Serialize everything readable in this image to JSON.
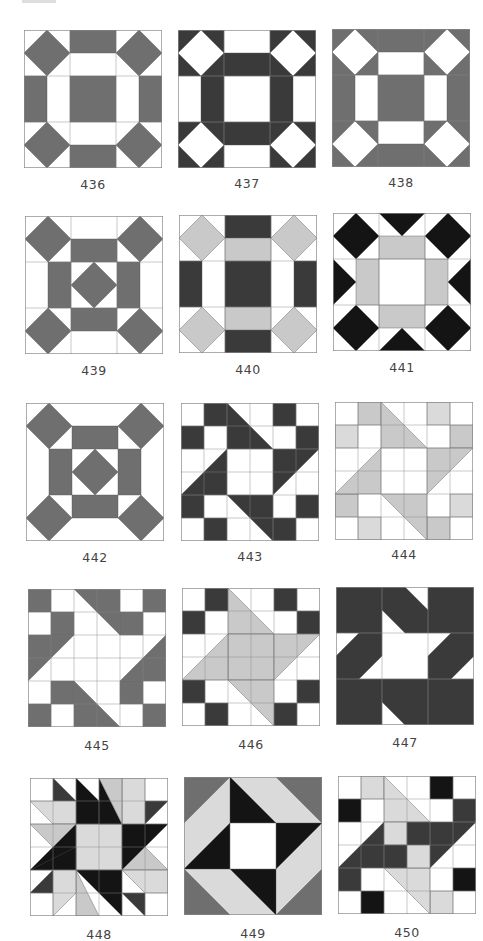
{
  "colors": {
    "white": "#ffffff",
    "medium": "#6f6f6f",
    "dark": "#3a3a3a",
    "black": "#141414",
    "light": "#c9c9c9",
    "pale": "#dadada",
    "grid": "#8a8a8a"
  },
  "blocks": [
    {
      "number": "436",
      "x": 24,
      "y": 30,
      "label_y": 185,
      "grid": 3,
      "bg": "white",
      "shapes": [
        [
          "medium",
          "2,0 4,0 4,1 2,1"
        ],
        [
          "medium",
          "2,5 4,5 4,6 2,6"
        ],
        [
          "medium",
          "0,2 1,2 1,4 0,4"
        ],
        [
          "medium",
          "5,2 6,2 6,4 5,4"
        ],
        [
          "medium",
          "2,2 4,2 4,4 2,4"
        ],
        [
          "medium",
          "1,0 2,1 1,2 0,1"
        ],
        [
          "medium",
          "5,0 6,1 5,2 4,1"
        ],
        [
          "medium",
          "1,4 2,5 1,6 0,5"
        ],
        [
          "medium",
          "5,4 6,5 5,6 4,5"
        ]
      ]
    },
    {
      "number": "437",
      "x": 178,
      "y": 30,
      "label_y": 184,
      "grid": 3,
      "bg": "white",
      "shapes": [
        [
          "dark",
          "0,0 2,0 2,2 0,2"
        ],
        [
          "dark",
          "4,0 6,0 6,2 4,2"
        ],
        [
          "dark",
          "0,4 2,4 2,6 0,6"
        ],
        [
          "dark",
          "4,4 6,4 6,6 4,6"
        ],
        [
          "white",
          "1,0 2,1 1,2 0,1"
        ],
        [
          "white",
          "5,0 6,1 5,2 4,1"
        ],
        [
          "white",
          "1,4 2,5 1,6 0,5"
        ],
        [
          "white",
          "5,4 6,5 5,6 4,5"
        ],
        [
          "dark",
          "2,1 4,1 4,2 2,2"
        ],
        [
          "dark",
          "2,4 4,4 4,5 2,5"
        ],
        [
          "dark",
          "1,2 2,2 2,4 1,4"
        ],
        [
          "dark",
          "4,2 5,2 5,4 4,4"
        ]
      ]
    },
    {
      "number": "438",
      "x": 332,
      "y": 29,
      "label_y": 183,
      "grid": 3,
      "bg": "medium",
      "shapes": [
        [
          "white",
          "1,0 2,1 1,2 0,1"
        ],
        [
          "white",
          "5,0 6,1 5,2 4,1"
        ],
        [
          "white",
          "1,4 2,5 1,6 0,5"
        ],
        [
          "white",
          "5,4 6,5 5,6 4,5"
        ],
        [
          "white",
          "2,1 4,1 4,2 2,2"
        ],
        [
          "white",
          "2,4 4,4 4,5 2,5"
        ],
        [
          "white",
          "1,2 2,2 2,4 1,4"
        ],
        [
          "white",
          "4,2 5,2 5,4 4,4"
        ]
      ]
    },
    {
      "number": "439",
      "x": 25,
      "y": 216,
      "label_y": 371,
      "grid": 3,
      "bg": "white",
      "shapes": [
        [
          "medium",
          "2,1 4,1 4,2 2,2"
        ],
        [
          "medium",
          "2,4 4,4 4,5 2,5"
        ],
        [
          "medium",
          "1,2 2,2 2,4 1,4"
        ],
        [
          "medium",
          "4,2 5,2 5,4 4,4"
        ],
        [
          "medium",
          "3,2 4,3 3,4 2,3"
        ],
        [
          "medium",
          "1,0 2,1 1,2 0,1"
        ],
        [
          "medium",
          "5,0 6,1 5,2 4,1"
        ],
        [
          "medium",
          "1,4 2,5 1,6 0,5"
        ],
        [
          "medium",
          "5,4 6,5 5,6 4,5"
        ]
      ]
    },
    {
      "number": "440",
      "x": 179,
      "y": 215,
      "label_y": 370,
      "grid": 3,
      "bg": "white",
      "shapes": [
        [
          "dark",
          "2,0 4,0 4,1 2,1"
        ],
        [
          "dark",
          "2,5 4,5 4,6 2,6"
        ],
        [
          "dark",
          "2,2 4,2 4,4 2,4"
        ],
        [
          "dark",
          "0,2 1,2 1,4 0,4"
        ],
        [
          "dark",
          "5,2 6,2 6,4 5,4"
        ],
        [
          "light",
          "2,1 4,1 4,2 2,2"
        ],
        [
          "light",
          "2,4 4,4 4,5 2,5"
        ],
        [
          "light",
          "1,0 2,1 1,2 0,1"
        ],
        [
          "light",
          "5,0 6,1 5,2 4,1"
        ],
        [
          "light",
          "1,4 2,5 1,6 0,5"
        ],
        [
          "light",
          "5,4 6,5 5,6 4,5"
        ]
      ]
    },
    {
      "number": "441",
      "x": 333,
      "y": 213,
      "label_y": 368,
      "grid": 3,
      "bg": "white",
      "shapes": [
        [
          "black",
          "1,0 2,1 1,2 0,1"
        ],
        [
          "black",
          "5,0 6,1 5,2 4,1"
        ],
        [
          "black",
          "1,4 2,5 1,6 0,5"
        ],
        [
          "black",
          "5,4 6,5 5,6 4,5"
        ],
        [
          "black",
          "2,0 4,0 3,1"
        ],
        [
          "black",
          "2,6 4,6 3,5"
        ],
        [
          "black",
          "0,2 0,4 1,3"
        ],
        [
          "black",
          "6,2 6,4 5,3"
        ],
        [
          "light",
          "2,1 4,1 4,2 2,2"
        ],
        [
          "light",
          "2,4 4,4 4,5 2,5"
        ],
        [
          "light",
          "1,2 2,2 2,4 1,4"
        ],
        [
          "light",
          "4,2 5,2 5,4 4,4"
        ]
      ]
    },
    {
      "number": "442",
      "x": 26,
      "y": 403,
      "label_y": 558,
      "grid": 0,
      "bg": "white",
      "shapes": [
        [
          "medium",
          "2,1 4,1 4,2 2,2"
        ],
        [
          "medium",
          "2,4 4,4 4,5 2,5"
        ],
        [
          "medium",
          "1,2 2,2 2,4 1,4"
        ],
        [
          "medium",
          "4,2 5,2 5,4 4,4"
        ],
        [
          "medium",
          "3,2 4,3 3,4 2,3"
        ],
        [
          "medium",
          "1,0 2,1 1,2 0,1"
        ],
        [
          "medium",
          "5,0 6,1 5,2 4,1"
        ],
        [
          "medium",
          "1,4 2,5 1,6 0,5"
        ],
        [
          "medium",
          "5,4 6,5 5,6 4,5"
        ]
      ]
    },
    {
      "number": "443",
      "x": 181,
      "y": 403,
      "label_y": 557,
      "grid": 6,
      "bg": "white",
      "shapes": [
        [
          "dark",
          "1,0 2,0 2,1 1,1"
        ],
        [
          "dark",
          "0,1 1,1 1,2 0,2"
        ],
        [
          "dark",
          "4,0 5,0 5,1 4,1"
        ],
        [
          "dark",
          "5,1 6,1 6,2 5,2"
        ],
        [
          "dark",
          "0,4 1,4 1,5 0,5"
        ],
        [
          "dark",
          "1,5 2,5 2,6 1,6"
        ],
        [
          "dark",
          "5,4 6,4 6,5 5,5"
        ],
        [
          "dark",
          "4,5 5,5 5,6 4,6"
        ],
        [
          "dark",
          "2,0 4,2 2,2"
        ],
        [
          "dark",
          "4,2 6,2 4,4"
        ],
        [
          "dark",
          "2,2 2,4 0,4"
        ],
        [
          "dark",
          "2,4 4,4 4,6"
        ]
      ]
    },
    {
      "number": "444",
      "x": 335,
      "y": 402,
      "label_y": 555,
      "grid": 6,
      "bg": "white",
      "shapes": [
        [
          "light",
          "1,0 2,0 2,1 1,1"
        ],
        [
          "pale",
          "0,1 1,1 1,2 0,2"
        ],
        [
          "pale",
          "4,0 5,0 5,1 4,1"
        ],
        [
          "light",
          "5,1 6,1 6,2 5,2"
        ],
        [
          "light",
          "0,4 1,4 1,5 0,5"
        ],
        [
          "pale",
          "1,5 2,5 2,6 1,6"
        ],
        [
          "pale",
          "5,4 6,4 6,5 5,5"
        ],
        [
          "light",
          "4,5 5,5 5,6 4,6"
        ],
        [
          "light",
          "2,0 4,2 2,2"
        ],
        [
          "light",
          "4,2 6,2 4,4"
        ],
        [
          "light",
          "2,2 2,4 0,4"
        ],
        [
          "light",
          "2,4 4,4 4,6"
        ]
      ]
    },
    {
      "number": "445",
      "x": 28,
      "y": 589,
      "label_y": 746,
      "grid": 6,
      "bg": "white",
      "shapes": [
        [
          "medium",
          "0,0 1,0 1,1 0,1"
        ],
        [
          "medium",
          "1,1 2,1 2,2 1,2"
        ],
        [
          "medium",
          "5,0 6,0 6,1 5,1"
        ],
        [
          "medium",
          "4,1 5,1 5,2 4,2"
        ],
        [
          "medium",
          "1,4 2,4 2,5 1,5"
        ],
        [
          "medium",
          "0,5 1,5 1,6 0,6"
        ],
        [
          "medium",
          "4,4 5,4 5,5 4,5"
        ],
        [
          "medium",
          "5,5 6,5 6,6 5,6"
        ],
        [
          "medium",
          "2,0 4,0 4,2"
        ],
        [
          "medium",
          "0,2 2,2 0,4"
        ],
        [
          "medium",
          "6,2 6,4 4,4"
        ],
        [
          "medium",
          "2,4 2,6 4,6"
        ]
      ]
    },
    {
      "number": "446",
      "x": 182,
      "y": 588,
      "label_y": 745,
      "grid": 6,
      "bg": "white",
      "shapes": [
        [
          "dark",
          "1,0 2,0 2,1 1,1"
        ],
        [
          "dark",
          "0,1 1,1 1,2 0,2"
        ],
        [
          "dark",
          "4,0 5,0 5,1 4,1"
        ],
        [
          "dark",
          "5,1 6,1 6,2 5,2"
        ],
        [
          "dark",
          "0,4 1,4 1,5 0,5"
        ],
        [
          "dark",
          "1,5 2,5 2,6 1,6"
        ],
        [
          "dark",
          "5,4 6,4 6,5 5,5"
        ],
        [
          "dark",
          "4,5 5,5 5,6 4,6"
        ],
        [
          "light",
          "2,0 4,2 2,2"
        ],
        [
          "light",
          "2,2 4,2 4,4 2,4"
        ],
        [
          "light",
          "4,2 6,2 4,4"
        ],
        [
          "light",
          "2,2 2,4 0,4"
        ],
        [
          "light",
          "2,4 4,4 4,6"
        ]
      ]
    },
    {
      "number": "447",
      "x": 336,
      "y": 587,
      "label_y": 743,
      "grid": 3,
      "bg": "white",
      "shapes": [
        [
          "dark",
          "0,0 2,0 2,2 0,2"
        ],
        [
          "dark",
          "4,0 6,0 6,2 4,2"
        ],
        [
          "dark",
          "0,4 2,4 2,6 0,6"
        ],
        [
          "dark",
          "4,4 6,4 6,6 4,6"
        ],
        [
          "dark",
          "2,0 3,0 4,1 4,2 3,2 2,1"
        ],
        [
          "dark",
          "4,4 4,6 3,6 2,5 2,4 3,4"
        ],
        [
          "dark",
          "1,2 2,2 2,3 1,4 0,4 0,3"
        ],
        [
          "dark",
          "5,2 6,2 6,3 5,4 4,4 4,3"
        ]
      ]
    },
    {
      "number": "448",
      "x": 30,
      "y": 778,
      "label_y": 935,
      "grid": 6,
      "bg": "white",
      "shapes": [
        [
          "pale",
          "2,2 4,2 4,4 2,4"
        ],
        [
          "black",
          "2,0 4,2 2,2"
        ],
        [
          "black",
          "4,2 6,2 4,4"
        ],
        [
          "black",
          "2,2 2,4 0,4"
        ],
        [
          "black",
          "2,4 4,4 4,6"
        ],
        [
          "black",
          "3,0 4,2 3,2"
        ],
        [
          "black",
          "0,4 2,3 2,4"
        ],
        [
          "dark",
          "1,0 2,1 1,1"
        ],
        [
          "dark",
          "5,1 6,1 5,2"
        ],
        [
          "dark",
          "0,5 1,4 1,5"
        ],
        [
          "dark",
          "4,5 5,5 5,6"
        ],
        [
          "pale",
          "0,1 2,1 2,2 1,2"
        ],
        [
          "pale",
          "4,0 5,0 5,2 4,2 4,1"
        ],
        [
          "light",
          "3,0 4,0 4,2"
        ],
        [
          "light",
          "0,2 2,2 1,3"
        ],
        [
          "light",
          "6,4 4,4 5,3"
        ],
        [
          "light",
          "2,6 2,4 3,6"
        ],
        [
          "pale",
          "1,4 2,4 2,5 1,6"
        ],
        [
          "pale",
          "4,4 6,4 6,5 5,5"
        ]
      ]
    },
    {
      "number": "449",
      "x": 184,
      "y": 777,
      "label_y": 934,
      "grid": 0,
      "bg": "pale",
      "shapes": [
        [
          "medium",
          "0,0 2,0 0,2"
        ],
        [
          "medium",
          "4,0 6,0 6,2"
        ],
        [
          "medium",
          "0,4 0,6 2,6"
        ],
        [
          "medium",
          "6,4 6,6 4,6"
        ],
        [
          "black",
          "2,0 4,2 2,2"
        ],
        [
          "black",
          "4,2 6,2 4,4"
        ],
        [
          "black",
          "2,2 2,4 0,4"
        ],
        [
          "black",
          "2,4 4,4 4,6"
        ],
        [
          "white",
          "2,2 4,2 4,4 2,4"
        ]
      ]
    },
    {
      "number": "450",
      "x": 338,
      "y": 776,
      "label_y": 933,
      "grid": 6,
      "bg": "white",
      "shapes": [
        [
          "pale",
          "1,0 2,0 2,1 1,1"
        ],
        [
          "black",
          "0,1 1,1 1,2 0,2"
        ],
        [
          "black",
          "4,0 5,0 5,1 4,1"
        ],
        [
          "dark",
          "5,1 6,1 6,2 5,2"
        ],
        [
          "dark",
          "0,4 1,4 1,5 0,5"
        ],
        [
          "black",
          "1,5 2,5 2,6 1,6"
        ],
        [
          "black",
          "5,4 6,4 6,5 5,5"
        ],
        [
          "pale",
          "4,5 5,5 5,6 4,6"
        ],
        [
          "pale",
          "2,0 4,2 2,2"
        ],
        [
          "dark",
          "4,2 6,2 4,4"
        ],
        [
          "dark",
          "2,2 2,4 0,4"
        ],
        [
          "pale",
          "2,4 4,4 4,6"
        ],
        [
          "pale",
          "2,2 3,2 3,3 2,3"
        ],
        [
          "dark",
          "3,2 4,2 4,3 3,3"
        ],
        [
          "dark",
          "2,3 3,3 3,4 2,4"
        ],
        [
          "pale",
          "3,3 4,3 4,4 3,4"
        ]
      ]
    }
  ]
}
